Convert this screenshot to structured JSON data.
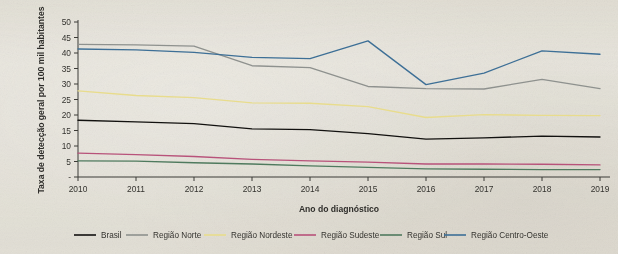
{
  "chart_data": {
    "type": "line",
    "title": "",
    "xlabel": "Ano do diagnóstico",
    "ylabel": "Taxa de detecção geral por 100 mil habitantes",
    "categories": [
      "2010",
      "2011",
      "2012",
      "2013",
      "2014",
      "2015",
      "2016",
      "2017",
      "2018",
      "2019"
    ],
    "x": [
      2010,
      2011,
      2012,
      2013,
      2014,
      2015,
      2016,
      2017,
      2018,
      2019
    ],
    "xlim": [
      2010,
      2019
    ],
    "ylim": [
      0,
      50
    ],
    "yticks": [
      "-",
      "5",
      "10",
      "15",
      "20",
      "25",
      "30",
      "35",
      "40",
      "45",
      "50"
    ],
    "ytick_values": [
      0,
      5,
      10,
      15,
      20,
      25,
      30,
      35,
      40,
      45,
      50
    ],
    "grid": false,
    "legend_position": "bottom",
    "series": [
      {
        "name": "Brasil",
        "color": "#12110f",
        "values": [
          18.3,
          17.8,
          17.2,
          15.5,
          15.3,
          14.0,
          12.2,
          12.6,
          13.2,
          12.9
        ]
      },
      {
        "name": "Região Norte",
        "color": "#8e918e",
        "values": [
          42.8,
          42.6,
          42.2,
          35.9,
          35.3,
          29.2,
          28.5,
          28.4,
          31.5,
          28.5
        ]
      },
      {
        "name": "Região Nordeste",
        "color": "#e8dc8c",
        "values": [
          27.8,
          26.3,
          25.6,
          23.9,
          23.8,
          22.7,
          19.2,
          20.1,
          19.9,
          19.8
        ]
      },
      {
        "name": "Região Sudeste",
        "color": "#b8527a",
        "values": [
          7.7,
          7.2,
          6.6,
          5.7,
          5.2,
          4.8,
          4.2,
          4.2,
          4.1,
          3.9
        ]
      },
      {
        "name": "Região Sul",
        "color": "#4f7a5e",
        "values": [
          5.2,
          5.1,
          4.6,
          4.2,
          3.6,
          3.1,
          2.6,
          2.5,
          2.4,
          2.4
        ]
      },
      {
        "name": "Região Centro-Oeste",
        "color": "#3d6f96",
        "values": [
          41.3,
          41.0,
          40.2,
          38.6,
          38.2,
          43.9,
          29.8,
          33.5,
          40.7,
          39.6
        ]
      }
    ]
  },
  "axes": {
    "y_title": "Taxa de detecção geral por 100 mil habitantes",
    "x_title": "Ano do diagnóstico"
  },
  "legend": {
    "items": [
      {
        "label": "Brasil",
        "color": "#12110f"
      },
      {
        "label": "Região Norte",
        "color": "#8e918e"
      },
      {
        "label": "Região Nordeste",
        "color": "#e8dc8c"
      },
      {
        "label": "Região Sudeste",
        "color": "#b8527a"
      },
      {
        "label": "Região Sul",
        "color": "#4f7a5e"
      },
      {
        "label": "Região Centro-Oeste",
        "color": "#3d6f96"
      }
    ]
  },
  "colors": {
    "paper": "#eeece6",
    "axis": "#3b3a36",
    "text": "#34332f"
  }
}
